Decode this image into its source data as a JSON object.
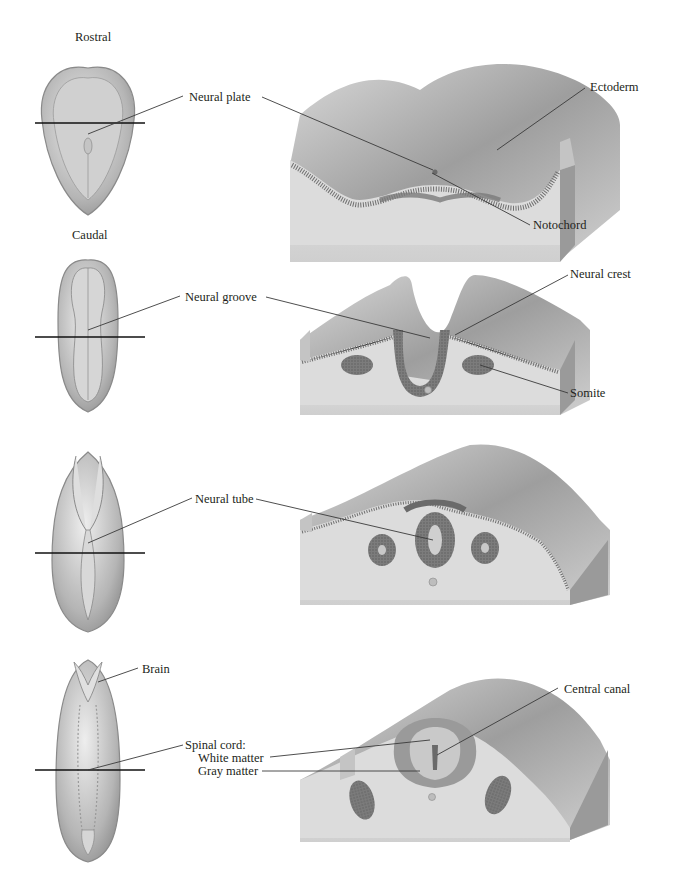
{
  "figure": {
    "orientation_labels": {
      "top": "Rostral",
      "bottom": "Caudal"
    },
    "stages": [
      {
        "id": "neural-plate-stage",
        "labels": [
          {
            "key": "neural_plate",
            "text": "Neural plate"
          },
          {
            "key": "ectoderm",
            "text": "Ectoderm"
          },
          {
            "key": "notochord",
            "text": "Notochord"
          }
        ]
      },
      {
        "id": "neural-groove-stage",
        "labels": [
          {
            "key": "neural_groove",
            "text": "Neural groove"
          },
          {
            "key": "neural_crest",
            "text": "Neural crest"
          },
          {
            "key": "somite",
            "text": "Somite"
          }
        ]
      },
      {
        "id": "neural-tube-stage",
        "labels": [
          {
            "key": "neural_tube",
            "text": "Neural tube"
          }
        ]
      },
      {
        "id": "brain-spinal-cord-stage",
        "labels": [
          {
            "key": "brain",
            "text": "Brain"
          },
          {
            "key": "spinal_cord",
            "text": "Spinal cord:"
          },
          {
            "key": "white_matter",
            "text": "White matter"
          },
          {
            "key": "gray_matter",
            "text": "Gray matter"
          },
          {
            "key": "central_canal",
            "text": "Central canal"
          }
        ]
      }
    ]
  },
  "colors": {
    "tissue_light": "#e6e6e6",
    "tissue_mid": "#bdbdbd",
    "tissue_dark": "#7a7a7a",
    "neural_tissue": "#6e6e6e",
    "leader_line": "#3a3a3a"
  }
}
